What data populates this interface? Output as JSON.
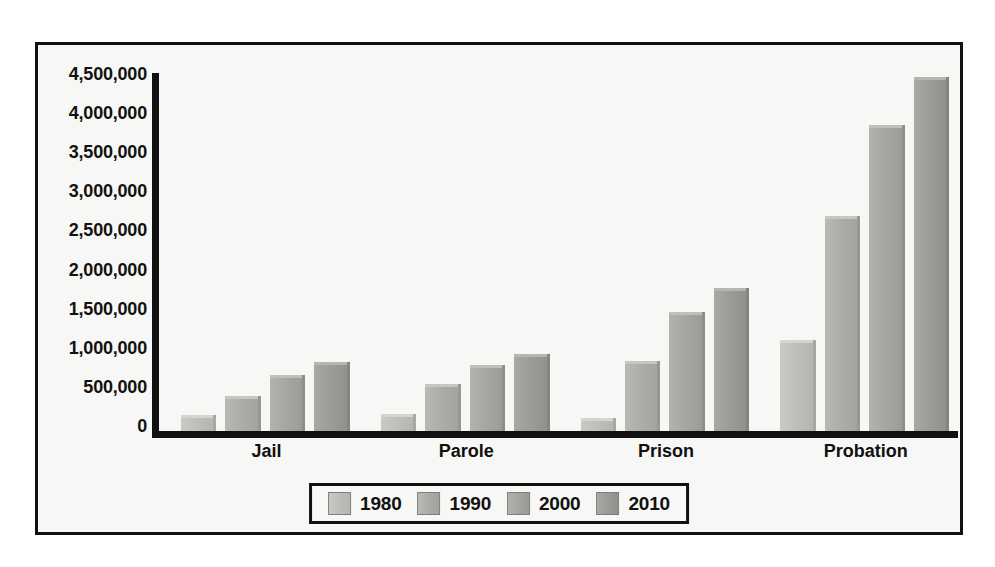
{
  "chart_data": {
    "type": "bar",
    "title": "",
    "subtitle": "",
    "xlabel": "",
    "ylabel": "",
    "categories": [
      "Jail",
      "Parole",
      "Prison",
      "Probation"
    ],
    "series": [
      {
        "name": "1980",
        "color": "#bcbcb8",
        "values": [
          200000,
          220000,
          160000,
          1150000
        ]
      },
      {
        "name": "1990",
        "color": "#aaaaa6",
        "values": [
          440000,
          590000,
          880000,
          2700000
        ]
      },
      {
        "name": "2000",
        "color": "#a3a39f",
        "values": [
          710000,
          830000,
          1500000,
          3850000
        ]
      },
      {
        "name": "2010",
        "color": "#999995",
        "values": [
          870000,
          970000,
          1800000,
          4450000
        ]
      }
    ],
    "ylim": [
      0,
      4500000
    ],
    "ytick_step": 500000,
    "ytick_labels": [
      "4,500,000",
      "4,000,000",
      "3,500,000",
      "3,000,000",
      "2,500,000",
      "2,000,000",
      "1,500,000",
      "1,000,000",
      "500,000",
      "0"
    ],
    "ytick_values": [
      4500000,
      4000000,
      3500000,
      3000000,
      2500000,
      2000000,
      1500000,
      1000000,
      500000,
      0
    ],
    "grid": false,
    "legend_position": "bottom-center",
    "legend_entries": [
      "1980",
      "1990",
      "2000",
      "2010"
    ]
  }
}
